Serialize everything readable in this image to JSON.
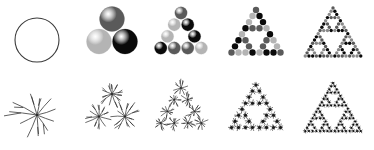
{
  "figure": {
    "background_color": "#ffffff",
    "width": 374,
    "height": 150,
    "rows": 2,
    "columns": 5
  },
  "palette": {
    "outline": "#3a3a3a",
    "black": "#0a0a0a",
    "dark_gray": "#5a5a5a",
    "mid_gray": "#8a8a8a",
    "light_gray": "#b4b4b4",
    "star_ink": "#2b2b2b",
    "background": "#ffffff"
  },
  "rows": [
    {
      "name": "sphere-row",
      "label": "Circle / sphere motif",
      "motif": "circle",
      "y": 0,
      "panels": [
        {
          "name": "panel-top-level-0",
          "label": "Level 0",
          "iteration": 0,
          "element_count": 1,
          "x": 0,
          "width": 75,
          "motif": "open-circle",
          "radius": 22,
          "cx": 37,
          "cy": 40,
          "fill": "none",
          "stroke": "#3a3a3a",
          "stroke_width": 1.1
        },
        {
          "name": "panel-top-level-1",
          "label": "Level 1",
          "iteration": 1,
          "element_count": 3,
          "x": 70,
          "width": 82,
          "motif": "filled-sphere",
          "radius": 12.5,
          "spread": 26,
          "apex": {
            "cx": 42,
            "cy": 19
          },
          "colors": [
            "#5a5a5a",
            "#b4b4b4",
            "#0a0a0a"
          ]
        },
        {
          "name": "panel-top-level-2",
          "label": "Level 2",
          "iteration": 2,
          "element_count": 9,
          "x": 143,
          "width": 76,
          "motif": "filled-sphere",
          "radius": 6.2,
          "spread": 13.5,
          "apex": {
            "cx": 38,
            "cy": 13
          },
          "colors": [
            "#5a5a5a",
            "#b4b4b4",
            "#0a0a0a"
          ]
        },
        {
          "name": "panel-top-level-3",
          "label": "Level 3",
          "iteration": 3,
          "element_count": 27,
          "x": 216,
          "width": 80,
          "motif": "filled-sphere",
          "radius": 3.2,
          "spread": 7.0,
          "apex": {
            "cx": 40,
            "cy": 10
          },
          "colors": [
            "#5a5a5a",
            "#b4b4b4",
            "#0a0a0a"
          ]
        },
        {
          "name": "panel-top-level-4",
          "label": "Level 4",
          "iteration": 4,
          "element_count": 81,
          "x": 292,
          "width": 82,
          "motif": "filled-sphere",
          "radius": 1.7,
          "spread": 3.7,
          "apex": {
            "cx": 41,
            "cy": 8
          },
          "colors": [
            "#5a5a5a",
            "#8a8a8a",
            "#0a0a0a"
          ]
        }
      ]
    },
    {
      "name": "star-row",
      "label": "Radiating star / dendrite motif",
      "motif": "star",
      "y": 75,
      "panels": [
        {
          "name": "panel-bottom-level-0",
          "label": "Level 0",
          "iteration": 0,
          "element_count": 1,
          "x": 0,
          "width": 75,
          "motif": "dendrite-star",
          "radius": 24,
          "cx": 37,
          "cy": 40,
          "rays": 11,
          "stroke": "#2b2b2b",
          "stroke_width": 0.75
        },
        {
          "name": "panel-bottom-level-1",
          "label": "Level 1",
          "iteration": 1,
          "element_count": 3,
          "x": 70,
          "width": 82,
          "motif": "dendrite-star",
          "radius": 13,
          "spread": 26,
          "apex": {
            "cx": 42,
            "cy": 19
          },
          "rays": 11,
          "stroke": "#2b2b2b",
          "stroke_width": 0.7
        },
        {
          "name": "panel-bottom-level-2",
          "label": "Level 2",
          "iteration": 2,
          "element_count": 9,
          "x": 143,
          "width": 76,
          "motif": "dendrite-star",
          "radius": 6.8,
          "spread": 13.5,
          "apex": {
            "cx": 38,
            "cy": 13
          },
          "rays": 9,
          "stroke": "#2b2b2b",
          "stroke_width": 0.65
        },
        {
          "name": "panel-bottom-level-3",
          "label": "Level 3",
          "iteration": 3,
          "element_count": 27,
          "x": 216,
          "width": 80,
          "motif": "dendrite-star",
          "radius": 3.4,
          "spread": 7.0,
          "apex": {
            "cx": 40,
            "cy": 10
          },
          "rays": 8,
          "stroke": "#1a1a1a",
          "stroke_width": 0.6
        },
        {
          "name": "panel-bottom-level-4",
          "label": "Level 4",
          "iteration": 4,
          "element_count": 81,
          "x": 292,
          "width": 82,
          "motif": "dendrite-star",
          "radius": 1.8,
          "spread": 3.7,
          "apex": {
            "cx": 41,
            "cy": 8
          },
          "rays": 6,
          "stroke": "#0a0a0a",
          "stroke_width": 0.55
        }
      ]
    }
  ]
}
